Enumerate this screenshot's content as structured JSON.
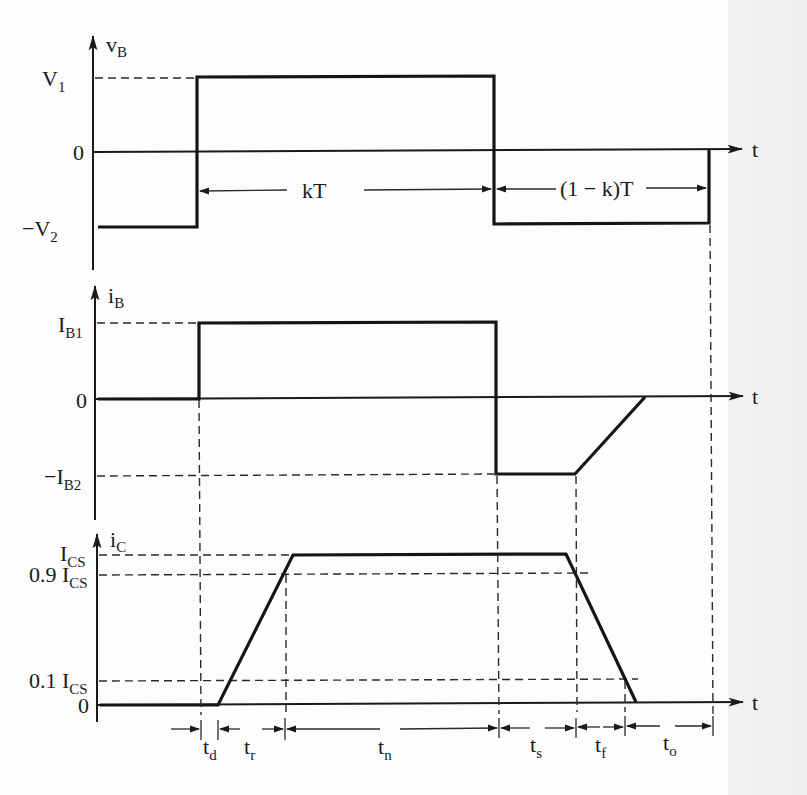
{
  "diagram": {
    "type": "transistor switching waveforms",
    "panels": [
      {
        "id": "vB",
        "axis_label": "v",
        "axis_label_sub": "B",
        "time_label": "t",
        "levels": [
          {
            "label": "V",
            "sub": "1",
            "prefix": ""
          },
          {
            "label": "0",
            "sub": "",
            "prefix": ""
          },
          {
            "label": "V",
            "sub": "2",
            "prefix": "−"
          }
        ],
        "spans": [
          {
            "label": "kT"
          },
          {
            "label": "(1 − k)T"
          }
        ]
      },
      {
        "id": "iB",
        "axis_label": "i",
        "axis_label_sub": "B",
        "time_label": "t",
        "levels": [
          {
            "label": "I",
            "sub": "B1",
            "prefix": ""
          },
          {
            "label": "0",
            "sub": "",
            "prefix": ""
          },
          {
            "label": "I",
            "sub": "B2",
            "prefix": "−"
          }
        ]
      },
      {
        "id": "iC",
        "axis_label": "i",
        "axis_label_sub": "C",
        "time_label": "t",
        "levels": [
          {
            "label": "I",
            "sub": "CS",
            "prefix": ""
          },
          {
            "label": "I",
            "sub": "CS",
            "prefix": "0.9 "
          },
          {
            "label": "I",
            "sub": "CS",
            "prefix": "0.1 "
          },
          {
            "label": "0",
            "sub": "",
            "prefix": ""
          }
        ]
      }
    ],
    "intervals": [
      {
        "label": "t",
        "sub": "d"
      },
      {
        "label": "t",
        "sub": "r"
      },
      {
        "label": "t",
        "sub": "n"
      },
      {
        "label": "t",
        "sub": "s"
      },
      {
        "label": "t",
        "sub": "f"
      },
      {
        "label": "t",
        "sub": "o"
      }
    ],
    "colors": {
      "ink": "#1a1a1a",
      "background": "#fdfdfd",
      "margin_gray": "#efefef"
    }
  }
}
